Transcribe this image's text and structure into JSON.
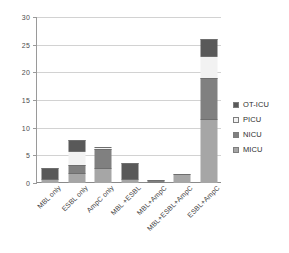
{
  "chart_data": {
    "type": "bar",
    "stacked": true,
    "title": "",
    "xlabel": "",
    "ylabel": "",
    "ylim": [
      0,
      30
    ],
    "yticks": [
      0,
      5,
      10,
      15,
      20,
      25,
      30
    ],
    "grid": true,
    "legend_position": "right",
    "categories": [
      "MBL only",
      "ESBL only",
      "AmpC only",
      "MBL +ESBL",
      "MBL+AmpC",
      "MBL+ESBL+AmpC",
      "ESBL+AmpC"
    ],
    "series": [
      {
        "name": "MICU",
        "color": "#a6a6a6",
        "values": [
          0.7,
          1.8,
          2.8,
          0.7,
          0.0,
          1.7,
          11.5
        ]
      },
      {
        "name": "NICU",
        "color": "#808080",
        "values": [
          0.0,
          1.5,
          3.4,
          0.0,
          0.5,
          0.0,
          7.5
        ]
      },
      {
        "name": "PICU",
        "color": "#f2f2f2",
        "values": [
          0.0,
          2.5,
          0.3,
          0.0,
          0.0,
          0.0,
          4.0
        ]
      },
      {
        "name": "OT-ICU",
        "color": "#595959",
        "values": [
          2.1,
          2.0,
          0.0,
          2.9,
          0.0,
          0.0,
          3.0
        ]
      }
    ]
  },
  "legend": {
    "items": [
      {
        "label": "OT-ICU",
        "color": "#595959"
      },
      {
        "label": "PICU",
        "color": "#f2f2f2"
      },
      {
        "label": "NICU",
        "color": "#808080"
      },
      {
        "label": "MICU",
        "color": "#a6a6a6"
      }
    ]
  }
}
